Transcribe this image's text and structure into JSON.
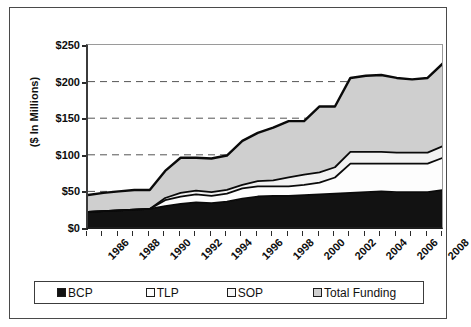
{
  "chart_data": {
    "type": "area",
    "title": "",
    "subtitle": "",
    "xlabel": "",
    "ylabel": "($ In Millions)",
    "stacked": true,
    "grid": "horizontal-dashed",
    "legend_position": "bottom",
    "xlim": [
      1986,
      2009
    ],
    "ylim": [
      0,
      250
    ],
    "ytick_labels": [
      "$250",
      "$200",
      "$150",
      "$100",
      "$50",
      "$0"
    ],
    "ytick_values": [
      250,
      200,
      150,
      100,
      50,
      0
    ],
    "xtick_labels": [
      "1986",
      "1988",
      "1990",
      "1992",
      "1994",
      "1996",
      "1998",
      "2000",
      "2002",
      "2004",
      "2006",
      "2008"
    ],
    "xtick_values": [
      1986,
      1988,
      1990,
      1992,
      1994,
      1996,
      1998,
      2000,
      2002,
      2004,
      2006,
      2008
    ],
    "x": [
      1986,
      1987,
      1988,
      1989,
      1990,
      1991,
      1992,
      1993,
      1994,
      1995,
      1996,
      1997,
      1998,
      1999,
      2000,
      2001,
      2002,
      2003,
      2004,
      2005,
      2006,
      2007,
      2008,
      2009
    ],
    "series": [
      {
        "name": "BCP",
        "color": "#121212",
        "values": [
          22,
          23,
          24,
          25,
          26,
          30,
          33,
          35,
          34,
          36,
          40,
          43,
          44,
          44,
          45,
          46,
          47,
          48,
          49,
          50,
          49,
          49,
          49,
          52
        ]
      },
      {
        "name": "TLP",
        "color": "#fdfdfd",
        "values": [
          0,
          0,
          0,
          0,
          0,
          8,
          10,
          11,
          10,
          11,
          14,
          14,
          13,
          13,
          14,
          16,
          22,
          40,
          39,
          38,
          39,
          39,
          39,
          44
        ]
      },
      {
        "name": "SOP",
        "color": "#f2f2f2",
        "values": [
          0,
          0,
          0,
          0,
          0,
          3,
          5,
          5,
          5,
          5,
          5,
          7,
          8,
          12,
          14,
          14,
          14,
          16,
          16,
          16,
          15,
          15,
          15,
          16
        ]
      },
      {
        "name": "Total Funding",
        "color": "#cfcfcf",
        "values": [
          23,
          25,
          26,
          27,
          26,
          37,
          48,
          45,
          46,
          47,
          60,
          66,
          72,
          77,
          73,
          90,
          83,
          101,
          104,
          105,
          102,
          100,
          102,
          113
        ]
      }
    ],
    "totals": [
      45,
      48,
      50,
      52,
      52,
      78,
      96,
      96,
      95,
      99,
      119,
      130,
      137,
      146,
      146,
      166,
      166,
      205,
      208,
      209,
      205,
      203,
      205,
      225
    ]
  },
  "legend": {
    "items": [
      {
        "label": "BCP",
        "color": "#121212"
      },
      {
        "label": "TLP",
        "color": "#fdfdfd"
      },
      {
        "label": "SOP",
        "color": "#f7f7f7"
      },
      {
        "label": "Total Funding",
        "color": "#cfcfcf"
      }
    ]
  },
  "axis": {
    "y_title": "($ In Millions)"
  }
}
